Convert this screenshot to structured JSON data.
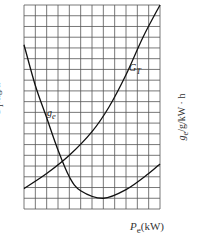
{
  "chart_data": {
    "type": "line",
    "title": "",
    "xlabel": "P_e (kW)",
    "ylabel_left": "G_T / kg/h",
    "ylabel_right": "g_e / g / kW·h",
    "grid": true,
    "grid_cols": 12,
    "grid_rows": 19,
    "axis_ticks": "none",
    "series": [
      {
        "name": "G_T",
        "label": "G",
        "subscript": "T",
        "note": "hourly fuel consumption, rises monotonically (convex)",
        "points_grid": [
          [
            0,
            1.9
          ],
          [
            2,
            3.3
          ],
          [
            4,
            5.0
          ],
          [
            6,
            7.2
          ],
          [
            7.5,
            9.5
          ],
          [
            9,
            12.5
          ],
          [
            10.5,
            16.0
          ],
          [
            12,
            19.0
          ]
        ]
      },
      {
        "name": "g_e",
        "label": "g",
        "subscript": "e",
        "note": "specific fuel consumption, U-shaped with minimum near middle",
        "points_grid": [
          [
            0,
            15.3
          ],
          [
            1,
            11.5
          ],
          [
            2,
            8.5
          ],
          [
            3,
            5.5
          ],
          [
            4,
            3.0
          ],
          [
            5,
            1.7
          ],
          [
            7,
            1.0
          ],
          [
            9,
            1.8
          ],
          [
            11,
            3.3
          ],
          [
            12,
            4.2
          ]
        ]
      }
    ]
  },
  "labels": {
    "y_left": "G",
    "y_left_sub": "T",
    "y_left_unit": "/kg/h",
    "y_right": "g",
    "y_right_sub": "e",
    "y_right_unit": "/g/kW · h",
    "x": "P",
    "x_sub": "e",
    "x_unit": "(kW)",
    "curve_GT": "G",
    "curve_GT_sub": "T",
    "curve_ge": "g",
    "curve_ge_sub": "e"
  },
  "colors": {
    "grid": "#555555",
    "curve": "#111111",
    "text": "#333333"
  }
}
